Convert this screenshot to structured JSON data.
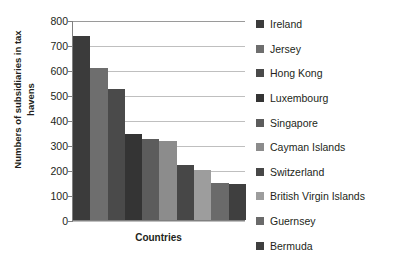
{
  "chart_data": {
    "type": "bar",
    "title": "",
    "xlabel": "Countries",
    "ylabel": "Numbers of subsidiaries in tax havens",
    "ylim": [
      0,
      800
    ],
    "ytick_step": 100,
    "yticks": [
      "800",
      "700",
      "600",
      "500",
      "400",
      "300",
      "200",
      "100",
      "0"
    ],
    "grid": true,
    "legend_position": "right",
    "categories": [
      "Ireland",
      "Jersey",
      "Hong Kong",
      "Luxembourg",
      "Singapore",
      "Cayman Islands",
      "Switzerland",
      "British Virgin Islands",
      "Guernsey",
      "Bermuda"
    ],
    "values": [
      735,
      610,
      525,
      345,
      325,
      315,
      220,
      200,
      150,
      145
    ],
    "colors": [
      "#3b3b3b",
      "#6e6e6e",
      "#4a4a4a",
      "#343434",
      "#5c5c5c",
      "#8c8c8c",
      "#474747",
      "#9d9d9d",
      "#6a6a6a",
      "#3f3f3f"
    ]
  },
  "axis": {
    "x_title": "Countries",
    "y_title_line1": "Numbers of subsidiaries in tax",
    "y_title_line2": "havens"
  }
}
